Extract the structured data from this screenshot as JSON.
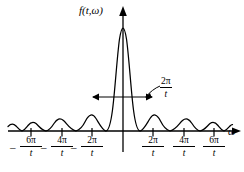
{
  "figure": {
    "type": "math-plot",
    "background_color": "#ffffff",
    "stroke_color": "#000000"
  },
  "axes": {
    "y_axis_label": "f(t,ω)",
    "x_axis_label": "ω",
    "origin_x": 123,
    "baseline_y": 131
  },
  "annotation": {
    "width_numerator": "2π",
    "width_denominator": "t",
    "meaning": "main lobe width 2π/t"
  },
  "ticks": [
    {
      "id": "neg-6pi-t",
      "minus": "–",
      "numerator": "6π",
      "denominator": "t",
      "x": 31
    },
    {
      "id": "neg-4pi-t",
      "minus": "–",
      "numerator": "4π",
      "denominator": "t",
      "x": 62
    },
    {
      "id": "neg-2pi-t",
      "minus": "–",
      "numerator": "2π",
      "denominator": "t",
      "x": 92
    },
    {
      "id": "pos-2pi-t",
      "minus": "",
      "numerator": "2π",
      "denominator": "t",
      "x": 153
    },
    {
      "id": "pos-4pi-t",
      "minus": "",
      "numerator": "4π",
      "denominator": "t",
      "x": 184
    },
    {
      "id": "pos-6pi-t",
      "minus": "",
      "numerator": "6π",
      "denominator": "t",
      "x": 214
    }
  ],
  "chart_data": {
    "type": "line",
    "title": "",
    "xlabel": "ω",
    "ylabel": "f(t,ω)",
    "x_tick_labels": [
      "-6π/t",
      "-4π/t",
      "-2π/t",
      "2π/t",
      "4π/t",
      "6π/t"
    ],
    "x_tick_values": [
      -6,
      -4,
      -2,
      2,
      4,
      6
    ],
    "xlim": [
      -7.2,
      7.6
    ],
    "ylim": [
      0,
      1.08
    ],
    "grid": false,
    "legend": false,
    "annotations": [
      {
        "text": "2π/t",
        "kind": "double-headed-arrow",
        "from_x": -2,
        "to_x": 2,
        "at_y": 0.33
      }
    ],
    "curve_description": "|sin(x)/x| style lobes: tall main lobe centered at 0 with zeros at ±2π/t, decaying side lobes between successive zeros",
    "series": [
      {
        "name": "|f(t,ω)|",
        "x": [
          -7.2,
          -6.8,
          -6.4,
          -6.0,
          -5.6,
          -5.2,
          -5.0,
          -4.8,
          -4.4,
          -4.0,
          -3.6,
          -3.2,
          -3.0,
          -2.8,
          -2.4,
          -2.0,
          -1.7,
          -1.4,
          -1.1,
          -0.8,
          -0.4,
          0.0,
          0.4,
          0.8,
          1.1,
          1.4,
          1.7,
          2.0,
          2.4,
          2.8,
          3.0,
          3.2,
          3.6,
          4.0,
          4.4,
          4.8,
          5.0,
          5.2,
          5.6,
          6.0,
          6.4,
          6.8,
          7.2
        ],
        "y": [
          0.035,
          0.06,
          0.055,
          0.0,
          0.06,
          0.085,
          0.09,
          0.085,
          0.055,
          0.0,
          0.08,
          0.13,
          0.14,
          0.13,
          0.07,
          0.0,
          0.16,
          0.42,
          0.68,
          0.88,
          0.99,
          1.0,
          0.99,
          0.88,
          0.68,
          0.42,
          0.16,
          0.0,
          0.07,
          0.13,
          0.14,
          0.13,
          0.08,
          0.0,
          0.055,
          0.085,
          0.09,
          0.085,
          0.06,
          0.0,
          0.055,
          0.06,
          0.035
        ]
      }
    ]
  }
}
